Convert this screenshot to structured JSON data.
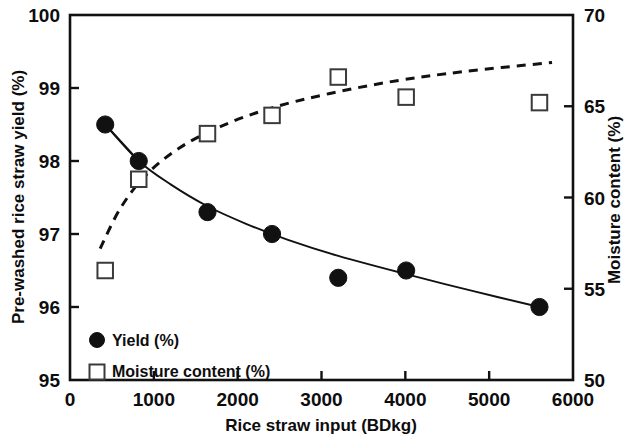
{
  "chart_data": {
    "type": "scatter",
    "title": "",
    "xlabel": "Rice straw input (BDkg)",
    "ylabel": "Pre-washed rice straw yield (%)",
    "y2label": "Moisture content (%)",
    "xlim": [
      0,
      6000
    ],
    "ylim": [
      95,
      100
    ],
    "y2lim": [
      50,
      70
    ],
    "grid": false,
    "legend_position": "lower-left",
    "x_ticks": [
      "0",
      "1000",
      "2000",
      "3000",
      "4000",
      "5000",
      "6000"
    ],
    "x_tick_values": [
      0,
      1000,
      2000,
      3000,
      4000,
      5000,
      6000
    ],
    "y_ticks": [
      "95",
      "96",
      "97",
      "98",
      "99",
      "100"
    ],
    "y_tick_values": [
      95,
      96,
      97,
      98,
      99,
      100
    ],
    "y2_ticks": [
      "50",
      "55",
      "60",
      "65",
      "70"
    ],
    "y2_tick_values": [
      50,
      55,
      60,
      65,
      70
    ],
    "series": [
      {
        "name": "Yield (%)",
        "axis": "left",
        "marker": "filled-circle",
        "line_style": "solid",
        "x": [
          420,
          820,
          1640,
          2410,
          3200,
          4010,
          5600
        ],
        "values": [
          98.5,
          98.0,
          97.3,
          97.0,
          96.4,
          96.5,
          96.0
        ]
      },
      {
        "name": "Moisture content (%)",
        "axis": "right",
        "marker": "open-square",
        "line_style": "dashed",
        "x": [
          420,
          820,
          1640,
          2410,
          3200,
          4010,
          5600
        ],
        "values": [
          56.0,
          61.0,
          63.5,
          64.5,
          66.6,
          65.5,
          65.2
        ]
      }
    ],
    "trend_lines": [
      {
        "name": "Yield trend",
        "axis": "left",
        "line_style": "solid",
        "x": [
          420,
          820,
          1200,
          1640,
          2100,
          2600,
          3200,
          4010,
          4800,
          5600
        ],
        "values": [
          98.5,
          98.0,
          97.68,
          97.38,
          97.14,
          96.92,
          96.7,
          96.45,
          96.22,
          96.0
        ]
      },
      {
        "name": "Moisture trend",
        "axis": "right",
        "line_style": "dashed",
        "x": [
          360,
          600,
          900,
          1300,
          1800,
          2400,
          3100,
          3900,
          4700,
          5750
        ],
        "values": [
          57.2,
          59.4,
          61.2,
          62.7,
          63.9,
          64.9,
          65.7,
          66.4,
          66.9,
          67.4
        ]
      }
    ]
  },
  "legend": {
    "items": [
      {
        "label": "Yield (%)",
        "marker": "filled-circle"
      },
      {
        "label": "Moisture content (%)",
        "marker": "open-square"
      }
    ]
  },
  "colors": {
    "axis": "#111111",
    "series_marker": "#111111",
    "background": "#ffffff"
  }
}
